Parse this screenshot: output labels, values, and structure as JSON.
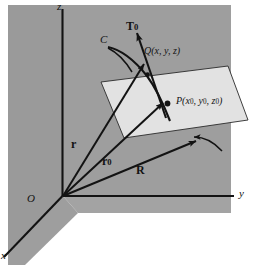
{
  "figure": {
    "colors": {
      "page_background": "#ffffff",
      "wall_gray": "#9e9e9e",
      "wall_gray_dark": "#949494",
      "plane_fill": "#e2e2e2",
      "ink": "#131313"
    },
    "axes": {
      "z_label": "z",
      "y_label": "y",
      "x_label": "x",
      "origin_label": "O"
    },
    "points": {
      "q_label_name": "Q",
      "q_label": "Q(x, y, z)",
      "q_coord_x": "x",
      "q_coord_y": "y",
      "q_coord_z": "z",
      "p_label_name": "P",
      "p_label": "P(x0, y0, z0)",
      "p_coord_x": "x",
      "p_coord_y": "y",
      "p_coord_z": "z",
      "p_sub": "0"
    },
    "vectors": {
      "tangent_label": "T",
      "tangent_sub": "0",
      "tangent_full": "T0",
      "r_label": "r",
      "r0_label": "r",
      "r0_sub": "0",
      "r0_full": "r0",
      "R_label": "R"
    },
    "curve": {
      "label": "C"
    }
  }
}
